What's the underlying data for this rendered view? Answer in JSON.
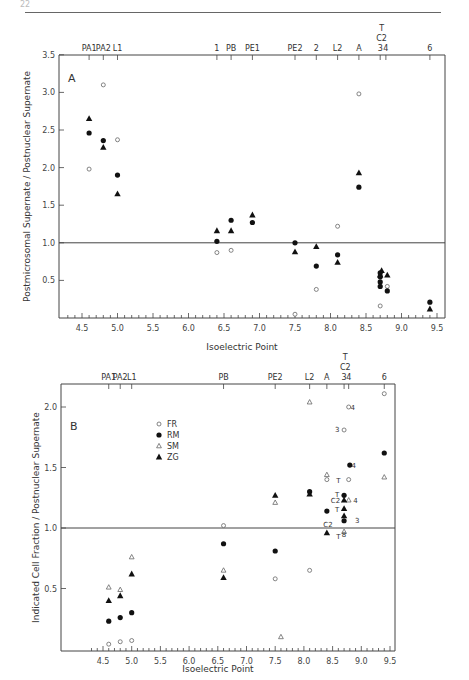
{
  "page": {
    "number": "22"
  },
  "chart_data": [
    {
      "panel": "A",
      "type": "scatter",
      "title": "",
      "xlabel": "Isoelectric Point",
      "ylabel": "Postmicrosomal Supernate / Postnuclear Supernate",
      "xlim": [
        4.2,
        9.6
      ],
      "ylim": [
        0,
        3.5
      ],
      "xticks": [
        "4.5",
        "5.0",
        "5.5",
        "6.0",
        "6.5",
        "7.0",
        "7.5",
        "8.0",
        "8.5",
        "9.0",
        "9.5"
      ],
      "yticks": [
        "0.5",
        "1.0",
        "1.5",
        "2.0",
        "2.5",
        "3.0",
        "3.5"
      ],
      "reference_line": 1.0,
      "grid": false,
      "top_labels": [
        {
          "label": "PA1",
          "x": 4.6
        },
        {
          "label": "PA2",
          "x": 4.8
        },
        {
          "label": "L1",
          "x": 5.0
        },
        {
          "label": "1",
          "x": 6.4
        },
        {
          "label": "PB",
          "x": 6.6
        },
        {
          "label": "PE1",
          "x": 6.9
        },
        {
          "label": "PE2",
          "x": 7.5
        },
        {
          "label": "2",
          "x": 7.8
        },
        {
          "label": "L2",
          "x": 8.1
        },
        {
          "label": "A",
          "x": 8.4
        },
        {
          "label": "3",
          "x": 8.7
        },
        {
          "label": "4",
          "x": 8.78
        },
        {
          "label": "6",
          "x": 9.4
        }
      ],
      "top_stack_labels": [
        "T",
        "C2"
      ],
      "series": [
        {
          "name": "FR",
          "marker": "open-circle",
          "points": [
            [
              4.6,
              1.98
            ],
            [
              4.8,
              3.1
            ],
            [
              5.0,
              2.37
            ],
            [
              6.4,
              0.87
            ],
            [
              6.6,
              0.9
            ],
            [
              7.5,
              0.05
            ],
            [
              7.8,
              0.38
            ],
            [
              8.1,
              1.22
            ],
            [
              8.4,
              2.98
            ],
            [
              8.7,
              0.16
            ],
            [
              8.8,
              0.42
            ]
          ]
        },
        {
          "name": "RM",
          "marker": "filled-circle",
          "points": [
            [
              4.6,
              2.46
            ],
            [
              4.8,
              2.36
            ],
            [
              5.0,
              1.9
            ],
            [
              6.4,
              1.02
            ],
            [
              6.6,
              1.3
            ],
            [
              6.9,
              1.27
            ],
            [
              7.5,
              1.0
            ],
            [
              7.8,
              0.69
            ],
            [
              8.1,
              0.84
            ],
            [
              8.4,
              1.74
            ],
            [
              8.7,
              0.6
            ],
            [
              8.7,
              0.55
            ],
            [
              8.7,
              0.48
            ],
            [
              8.7,
              0.42
            ],
            [
              8.8,
              0.36
            ],
            [
              9.4,
              0.21
            ]
          ]
        },
        {
          "name": "ZG",
          "marker": "filled-triangle",
          "points": [
            [
              4.6,
              2.65
            ],
            [
              4.8,
              2.27
            ],
            [
              5.0,
              1.65
            ],
            [
              6.4,
              1.16
            ],
            [
              6.6,
              1.16
            ],
            [
              6.9,
              1.37
            ],
            [
              7.5,
              0.88
            ],
            [
              7.8,
              0.95
            ],
            [
              8.1,
              0.74
            ],
            [
              8.4,
              1.93
            ],
            [
              8.72,
              0.63
            ],
            [
              8.7,
              0.57
            ],
            [
              8.8,
              0.57
            ],
            [
              9.4,
              0.12
            ]
          ]
        }
      ]
    },
    {
      "panel": "B",
      "type": "scatter",
      "title": "",
      "xlabel": "Isoelectric Point",
      "ylabel": "Indicated Cell Fraction / Postnuclear Supernate",
      "xlim": [
        4.2,
        9.6
      ],
      "ylim": [
        0,
        2.2
      ],
      "xticks": [
        "4.5",
        "5.0",
        "5.5",
        "6.0",
        "6.5",
        "7.0",
        "7.5",
        "8.0",
        "8.5",
        "9.0",
        "9.5"
      ],
      "yticks": [
        "0.5",
        "1.0",
        "1.5",
        "2.0"
      ],
      "reference_line": 1.0,
      "grid": false,
      "legend": {
        "position": "upper-left-center",
        "entries": [
          {
            "label": "FR",
            "marker": "open-circle"
          },
          {
            "label": "RM",
            "marker": "filled-circle"
          },
          {
            "label": "SM",
            "marker": "open-triangle"
          },
          {
            "label": "ZG",
            "marker": "filled-triangle"
          }
        ]
      },
      "top_labels": [
        {
          "label": "PA1",
          "x": 4.6
        },
        {
          "label": "PA2",
          "x": 4.8
        },
        {
          "label": "L1",
          "x": 5.0
        },
        {
          "label": "PB",
          "x": 6.6
        },
        {
          "label": "PE2",
          "x": 7.5
        },
        {
          "label": "L2",
          "x": 8.1
        },
        {
          "label": "A",
          "x": 8.4
        },
        {
          "label": "3",
          "x": 8.7
        },
        {
          "label": "4",
          "x": 8.78
        },
        {
          "label": "6",
          "x": 9.4
        }
      ],
      "top_stack_labels": [
        "T",
        "C2"
      ],
      "series": [
        {
          "name": "FR",
          "marker": "open-circle",
          "points": [
            [
              4.6,
              0.04
            ],
            [
              4.8,
              0.06
            ],
            [
              5.0,
              0.07
            ],
            [
              6.6,
              1.02
            ],
            [
              7.5,
              0.58
            ],
            [
              8.1,
              0.65
            ],
            [
              8.4,
              1.4
            ],
            [
              8.7,
              1.81
            ],
            [
              8.78,
              2.0
            ],
            [
              8.78,
              1.4
            ],
            [
              9.4,
              2.11
            ]
          ]
        },
        {
          "name": "RM",
          "marker": "filled-circle",
          "points": [
            [
              4.6,
              0.23
            ],
            [
              4.8,
              0.26
            ],
            [
              5.0,
              0.3
            ],
            [
              6.6,
              0.87
            ],
            [
              7.5,
              0.81
            ],
            [
              8.1,
              1.3
            ],
            [
              8.4,
              1.14
            ],
            [
              8.7,
              1.27
            ],
            [
              8.7,
              1.06
            ],
            [
              8.8,
              1.52
            ],
            [
              9.4,
              1.62
            ]
          ]
        },
        {
          "name": "SM",
          "marker": "open-triangle",
          "points": [
            [
              4.6,
              0.51
            ],
            [
              4.8,
              0.49
            ],
            [
              5.0,
              0.76
            ],
            [
              6.6,
              0.65
            ],
            [
              7.5,
              1.21
            ],
            [
              7.6,
              0.1
            ],
            [
              8.1,
              2.04
            ],
            [
              8.4,
              1.44
            ],
            [
              8.78,
              1.23
            ],
            [
              8.7,
              0.97
            ],
            [
              9.4,
              1.42
            ]
          ]
        },
        {
          "name": "ZG",
          "marker": "filled-triangle",
          "points": [
            [
              4.6,
              0.4
            ],
            [
              4.8,
              0.44
            ],
            [
              5.0,
              0.62
            ],
            [
              6.6,
              0.59
            ],
            [
              7.5,
              1.27
            ],
            [
              8.1,
              1.28
            ],
            [
              8.4,
              0.96
            ],
            [
              8.7,
              1.23
            ],
            [
              8.7,
              1.16
            ],
            [
              8.7,
              1.1
            ]
          ]
        }
      ],
      "annotations": [
        {
          "text": "4",
          "x": 8.85,
          "y": 2.0
        },
        {
          "text": "3",
          "x": 8.58,
          "y": 1.82
        },
        {
          "text": "4",
          "x": 8.87,
          "y": 1.52
        },
        {
          "text": "T",
          "x": 8.6,
          "y": 1.4
        },
        {
          "text": "T",
          "x": 8.58,
          "y": 1.28
        },
        {
          "text": "C2",
          "x": 8.55,
          "y": 1.23
        },
        {
          "text": "4",
          "x": 8.9,
          "y": 1.23
        },
        {
          "text": "T",
          "x": 8.58,
          "y": 1.16
        },
        {
          "text": "3",
          "x": 8.93,
          "y": 1.07
        },
        {
          "text": "C2",
          "x": 8.42,
          "y": 1.03
        },
        {
          "text": "T",
          "x": 8.6,
          "y": 0.93
        },
        {
          "text": "8",
          "x": 8.7,
          "y": 0.95
        }
      ]
    }
  ]
}
